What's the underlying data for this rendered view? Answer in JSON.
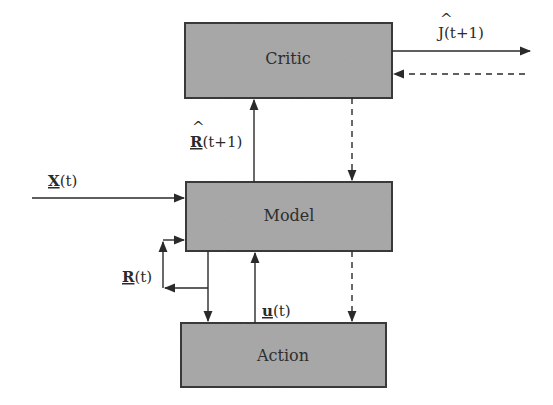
{
  "diagram": {
    "type": "block-diagram",
    "colors": {
      "box_fill": "#a9a9a9",
      "box_stroke": "#3a3a3a",
      "line": "#2a2a2a",
      "text": "#2e2e2e"
    },
    "blocks": [
      {
        "id": "critic",
        "label": "Critic"
      },
      {
        "id": "model",
        "label": "Model"
      },
      {
        "id": "action",
        "label": "Action"
      }
    ],
    "signals": {
      "j_hat": {
        "symbol": "J",
        "hat": "^",
        "arg": "(t+1)"
      },
      "r_hat": {
        "symbol": "R",
        "hat": "^",
        "arg": "(t+1)"
      },
      "x": {
        "symbol": "X",
        "arg": "(t)"
      },
      "r": {
        "symbol": "R",
        "arg": "(t)"
      },
      "u": {
        "symbol": "u",
        "arg": "(t)"
      }
    },
    "connections": [
      {
        "from": "critic",
        "to": "output",
        "label": "Ĵ(t+1)",
        "style": "solid"
      },
      {
        "from": "external",
        "to": "critic",
        "style": "dashed"
      },
      {
        "from": "model",
        "to": "critic",
        "label": "R̂(t+1)",
        "style": "solid"
      },
      {
        "from": "critic",
        "to": "model",
        "style": "dashed"
      },
      {
        "from": "input",
        "to": "model",
        "label": "X(t)",
        "style": "solid"
      },
      {
        "from": "model",
        "to": "model",
        "label": "R(t)",
        "style": "solid"
      },
      {
        "from": "model",
        "to": "action",
        "style": "solid"
      },
      {
        "from": "action",
        "to": "model",
        "label": "u(t)",
        "style": "solid"
      },
      {
        "from": "model",
        "to": "action",
        "style": "dashed"
      }
    ]
  }
}
